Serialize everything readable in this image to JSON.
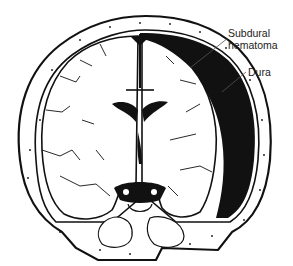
{
  "figure": {
    "labels": {
      "subdural_hematoma_line1": "Subdural",
      "subdural_hematoma_line2": "hematoma",
      "dura": "Dura"
    },
    "colors": {
      "ink": "#111111",
      "paper": "#ffffff",
      "leader": "#555555"
    }
  }
}
